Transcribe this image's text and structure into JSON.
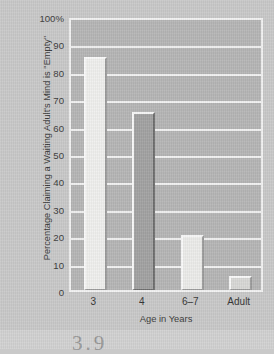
{
  "chart_data": {
    "type": "bar",
    "title": "",
    "subtitle": "",
    "xlabel": "Age in Years",
    "ylabel": "Percentage Claiming a Waiting Adult's Mind is \"Empty\"",
    "categories": [
      "3",
      "4",
      "6–7",
      "Adult"
    ],
    "values": [
      85,
      65,
      20,
      5
    ],
    "ylim": [
      0,
      100
    ],
    "ytick_labels": [
      "100%",
      "90",
      "80",
      "70",
      "60",
      "50",
      "40",
      "30",
      "20",
      "10",
      "0"
    ],
    "ytick_values": [
      100,
      90,
      80,
      70,
      60,
      50,
      40,
      30,
      20,
      10,
      0
    ],
    "grid": true,
    "legend": false,
    "legend_position": "none",
    "series": [
      {
        "name": "Percentage Claiming a Waiting Adult's Mind is \"Empty\"",
        "values": [
          85,
          65,
          20,
          5
        ]
      }
    ],
    "bar_colors": [
      "#f0f0ee",
      "#a2a2a2",
      "#ececea",
      "#d8d8d6"
    ],
    "plot_background": "#b6b6b6",
    "figure_background": "#c9c9c9",
    "grid_color": "#f2f2f2",
    "axis_color": "#f2f2f2"
  },
  "margin_note": "3.9"
}
